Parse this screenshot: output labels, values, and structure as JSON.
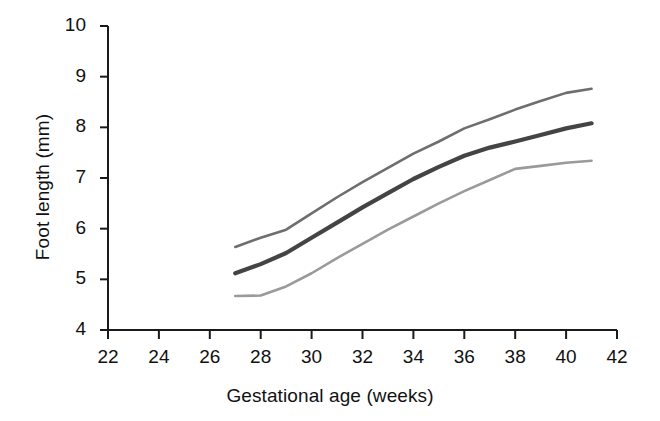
{
  "chart_data": {
    "type": "line",
    "title": "",
    "xlabel": "Gestational age (weeks)",
    "ylabel": "Foot length (mm)",
    "xlim": [
      22,
      42
    ],
    "ylim": [
      4,
      10
    ],
    "xticks": [
      "22",
      "24",
      "26",
      "28",
      "30",
      "32",
      "34",
      "36",
      "38",
      "40",
      "42"
    ],
    "yticks": [
      "4",
      "5",
      "6",
      "7",
      "8",
      "9",
      "10"
    ],
    "grid": false,
    "legend": "none",
    "x": [
      27,
      28,
      29,
      30,
      31,
      32,
      33,
      34,
      35,
      36,
      37,
      38,
      39,
      40,
      41
    ],
    "series": [
      {
        "name": "upper-centile",
        "color": "#6e6e6e",
        "width": 2.6,
        "values": [
          5.64,
          5.82,
          5.98,
          6.3,
          6.62,
          6.92,
          7.2,
          7.48,
          7.72,
          7.98,
          8.16,
          8.35,
          8.52,
          8.68,
          8.76
        ]
      },
      {
        "name": "median",
        "color": "#444444",
        "width": 4.2,
        "values": [
          5.12,
          5.3,
          5.52,
          5.82,
          6.12,
          6.42,
          6.7,
          6.98,
          7.22,
          7.44,
          7.6,
          7.72,
          7.85,
          7.98,
          8.08
        ]
      },
      {
        "name": "lower-centile",
        "color": "#9a9a9a",
        "width": 2.6,
        "values": [
          4.67,
          4.68,
          4.86,
          5.12,
          5.42,
          5.7,
          5.98,
          6.24,
          6.5,
          6.74,
          6.96,
          7.18,
          7.24,
          7.3,
          7.34
        ]
      }
    ]
  },
  "axes": {
    "x_axis_name": "x-axis",
    "y_axis_name": "y-axis"
  }
}
